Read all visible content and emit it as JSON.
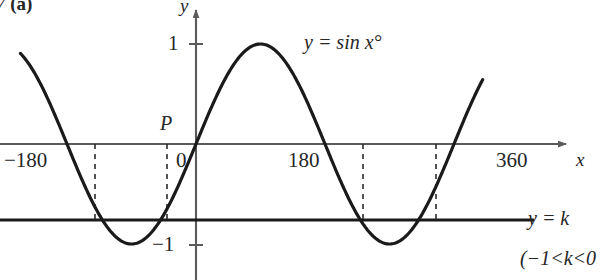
{
  "figure": {
    "exercise_number": "7",
    "exercise_part": "(a)"
  },
  "axes": {
    "y_axis_label": "y",
    "x_axis_label": "x",
    "y_ticks": [
      {
        "label": "1",
        "value": 1
      },
      {
        "label": "−1",
        "value": -1
      }
    ],
    "x_ticks": [
      {
        "label": "−180",
        "value": -180
      },
      {
        "label": "0",
        "value": 0
      },
      {
        "label": "180",
        "value": 180
      },
      {
        "label": "360",
        "value": 360
      }
    ]
  },
  "annotations": {
    "point_p": "P",
    "curve_equation": "y = sin x°",
    "line_equation": "y = k",
    "k_range": "(−1<k<0"
  },
  "colors": {
    "curve": "#1a1a1a",
    "axis": "#5a5a5a",
    "line_k": "#1a1a1a",
    "dashed": "#2b2b2b",
    "background": "#ffffff"
  },
  "chart_data": {
    "type": "line",
    "title": "",
    "xlabel": "x",
    "ylabel": "y",
    "xlim": [
      -245,
      405
    ],
    "ylim": [
      -1.4,
      1.4
    ],
    "grid": false,
    "legend": "inline-annotation",
    "series": [
      {
        "name": "y = sin x°",
        "kind": "sine",
        "amplitude": 1,
        "period": 360,
        "phase": 0,
        "x_start": -245,
        "x_end": 400,
        "key_points": [
          {
            "x": -180,
            "y": 0
          },
          {
            "x": -90,
            "y": -1
          },
          {
            "x": 0,
            "y": 0
          },
          {
            "x": 90,
            "y": 1
          },
          {
            "x": 180,
            "y": 0
          },
          {
            "x": 270,
            "y": -1
          },
          {
            "x": 360,
            "y": 0
          }
        ]
      },
      {
        "name": "y = k",
        "kind": "horizontal-line",
        "y": -0.76,
        "note": "−1 < k < 0"
      }
    ],
    "intersections": [
      {
        "x": -140,
        "y": -0.76
      },
      {
        "x": -40,
        "y": -0.76
      },
      {
        "x": 220,
        "y": -0.76
      },
      {
        "x": 320,
        "y": -0.76
      }
    ],
    "marked_points": [
      {
        "label": "P",
        "x": -40,
        "y": 0,
        "note": "on x-axis above intersection"
      }
    ]
  }
}
